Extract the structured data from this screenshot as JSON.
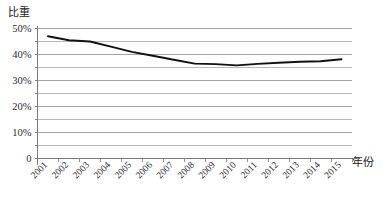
{
  "chart_data": {
    "type": "line",
    "title": "",
    "xlabel": "年份",
    "ylabel": "比重",
    "x": [
      2001,
      2002,
      2003,
      2004,
      2005,
      2006,
      2007,
      2008,
      2009,
      2010,
      2011,
      2012,
      2013,
      2014,
      2015
    ],
    "categories": [
      "2001",
      "2002",
      "2003",
      "2004",
      "2005",
      "2006",
      "2007",
      "2008",
      "2009",
      "2010",
      "2011",
      "2012",
      "2013",
      "2014",
      "2015"
    ],
    "values": [
      47,
      45.5,
      45,
      43,
      41,
      39.5,
      38,
      36.5,
      36.3,
      35.8,
      36.4,
      36.8,
      37.2,
      37.4,
      38.2
    ],
    "series": [
      {
        "name": "比重",
        "values": [
          47,
          45.5,
          45,
          43,
          41,
          39.5,
          38,
          36.5,
          36.3,
          35.8,
          36.4,
          36.8,
          37.2,
          37.4,
          38.2
        ]
      }
    ],
    "ylim": [
      0,
      50
    ],
    "ytick_values": [
      0,
      10,
      20,
      30,
      40,
      50
    ],
    "ytick_labels": [
      "0",
      "10%",
      "20%",
      "30%",
      "40%",
      "50%"
    ],
    "yminor_step": 5,
    "grid": true,
    "grid_minor": true,
    "legend": "none",
    "line_color": "#111111",
    "grid_color": "#9a9a9a",
    "axis_color": "#7a7a7a",
    "xtick_rotation": 45
  }
}
